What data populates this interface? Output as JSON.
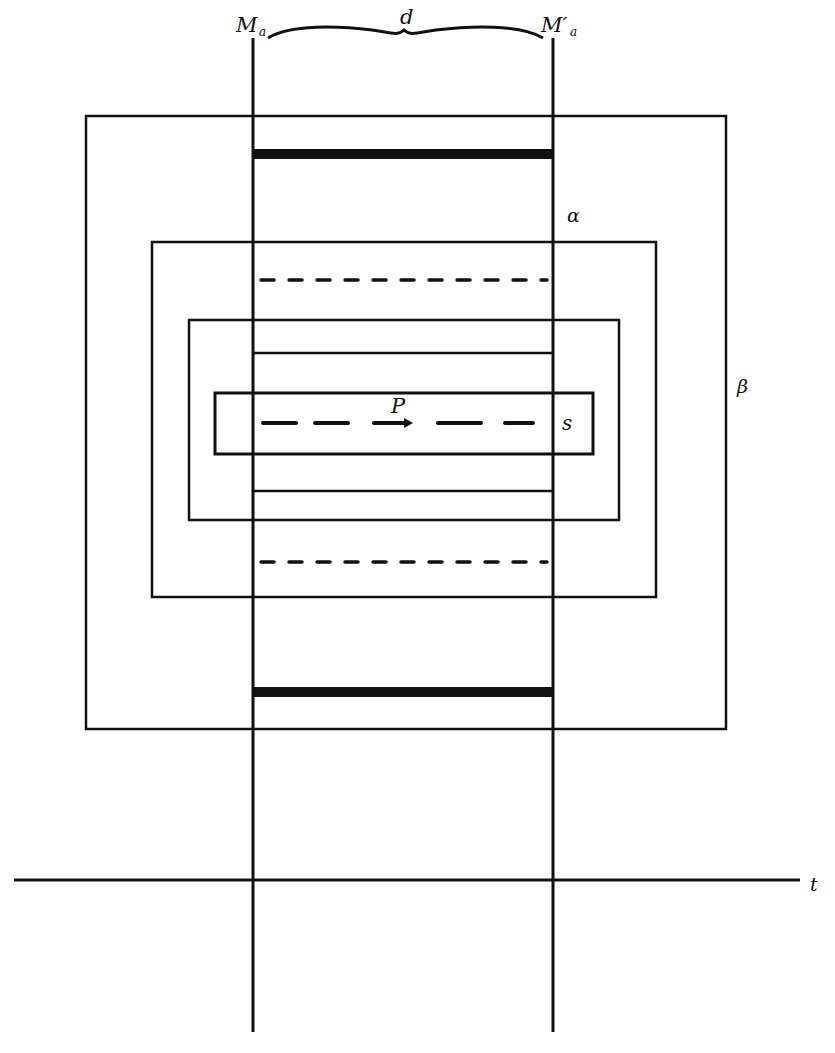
{
  "diagram": {
    "colors": {
      "ink": "#111111",
      "background": "#ffffff"
    },
    "labels": {
      "left_line": "M",
      "left_line_sub": "a",
      "right_line": "M′",
      "right_line_sub": "a",
      "distance": "d",
      "region_alpha": "α",
      "region_beta": "β",
      "region_s": "s",
      "point": "P",
      "time_axis": "t"
    },
    "vertical_lines": [
      {
        "name": "M_a",
        "x": 253,
        "y1": 40,
        "y2": 1032
      },
      {
        "name": "M'_a",
        "x": 553,
        "y1": 40,
        "y2": 1032
      }
    ],
    "rectangles": [
      {
        "name": "beta",
        "x": 86,
        "y": 116,
        "w": 640,
        "h": 613
      },
      {
        "name": "alpha",
        "x": 152,
        "y": 242,
        "w": 504,
        "h": 355
      },
      {
        "name": "inner",
        "x": 189,
        "y": 320,
        "w": 430,
        "h": 200
      },
      {
        "name": "s",
        "x": 215,
        "y": 393,
        "w": 378,
        "h": 61
      }
    ],
    "segments": [
      {
        "type": "thick",
        "y": 154,
        "x1": 253,
        "x2": 553
      },
      {
        "type": "thin",
        "y": 353,
        "x1": 253,
        "x2": 553
      },
      {
        "type": "thin",
        "y": 491,
        "x1": 253,
        "x2": 553
      },
      {
        "type": "dashed",
        "y": 280,
        "x1": 260,
        "x2": 547
      },
      {
        "type": "dashed",
        "y": 562,
        "x1": 260,
        "x2": 547
      },
      {
        "type": "long-dashed",
        "y": 423,
        "x1": 262,
        "x2": 535
      },
      {
        "type": "thick",
        "y": 692,
        "x1": 253,
        "x2": 553
      }
    ],
    "time_axis": {
      "y": 880,
      "x1": 14,
      "x2": 800
    }
  }
}
